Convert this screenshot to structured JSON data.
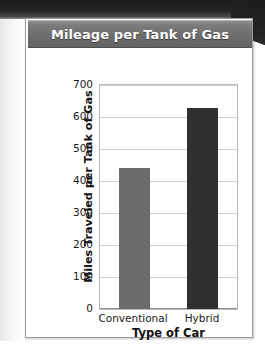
{
  "card": {
    "title": "Mileage per Tank of Gas"
  },
  "chart_data": {
    "type": "bar",
    "title": "Mileage per Tank of Gas",
    "categories": [
      "Conventional",
      "Hybrid"
    ],
    "values": [
      440,
      628
    ],
    "series": [
      {
        "name": "Miles Traveled per Tank of Gas (13.2 gallons)",
        "values": [
          440,
          628
        ]
      }
    ],
    "xlabel": "Type of Car",
    "ylabel": "Miles Traveled per Tank of Gas (13.2 gallons)",
    "ylabel_lines": [
      "Miles Traveled per Tank of Gas",
      "(13.2 gallons)"
    ],
    "ylim": [
      0,
      700
    ],
    "ytick_step": 100,
    "yticks": [
      "700",
      "600",
      "500",
      "400",
      "300",
      "200",
      "100",
      "0"
    ],
    "ytick_values": [
      700,
      600,
      500,
      400,
      300,
      200,
      100,
      0
    ],
    "grid": true,
    "legend": "none",
    "bar_colors": [
      "#6b6b6b",
      "#303030"
    ]
  },
  "colors": {
    "title_bar": "#6e6e6e",
    "title_text": "#ffffff",
    "gridline": "#cfcfcf",
    "plot_border": "#b8b8b8",
    "card_border": "#9c9c9c",
    "bar_conventional": "#6b6b6b",
    "bar_hybrid": "#303030",
    "page_background": "#fdfdfd",
    "scan_edge": "#212121"
  }
}
